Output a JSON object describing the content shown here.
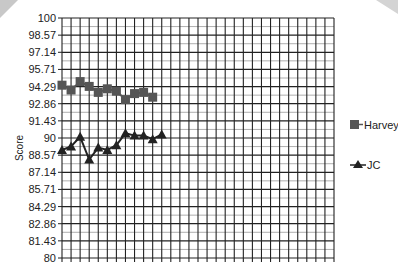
{
  "chart_data": {
    "type": "line",
    "title": "",
    "xlabel": "",
    "ylabel": "Score",
    "ylim": [
      80,
      100
    ],
    "yticks": [
      "100",
      "98.57",
      "97.14",
      "95.71",
      "94.29",
      "92.86",
      "91.43",
      "90",
      "88.57",
      "87.14",
      "85.71",
      "84.29",
      "82.86",
      "81.43",
      "80"
    ],
    "grid": true,
    "x_count": 30,
    "legend_position": "right",
    "series": [
      {
        "name": "Harvey",
        "marker": "square",
        "color": "#555555",
        "values": [
          94.4,
          94.0,
          94.7,
          94.3,
          93.8,
          94.1,
          93.9,
          93.2,
          93.7,
          93.8,
          93.4
        ]
      },
      {
        "name": "JC",
        "marker": "triangle",
        "color": "#222222",
        "values": [
          89.0,
          89.3,
          90.1,
          88.2,
          89.2,
          89.0,
          89.4,
          90.4,
          90.2,
          90.2,
          89.9,
          90.3
        ]
      }
    ]
  },
  "legend": {
    "items": [
      {
        "label": "Harvey"
      },
      {
        "label": "JC"
      }
    ]
  },
  "axis": {
    "ylabel": "Score"
  }
}
